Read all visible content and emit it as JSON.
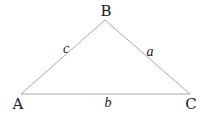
{
  "diagram": {
    "type": "triangle",
    "line_color": "#a8a8a8",
    "text_color": "#1a1a1a",
    "vertices": {
      "A": {
        "label": "A",
        "x": 21,
        "y": 94
      },
      "B": {
        "label": "B",
        "x": 105,
        "y": 20
      },
      "C": {
        "label": "C",
        "x": 190,
        "y": 94
      }
    },
    "sides": {
      "a": {
        "label": "a",
        "from": "B",
        "to": "C"
      },
      "b": {
        "label": "b",
        "from": "A",
        "to": "C"
      },
      "c": {
        "label": "c",
        "from": "A",
        "to": "B"
      }
    }
  }
}
